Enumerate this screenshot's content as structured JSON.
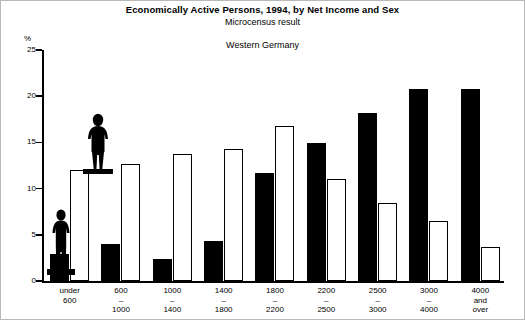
{
  "header": {
    "title": "Economically Active Persons, 1994, by Net Income and Sex",
    "subtitle": "Microcensus result",
    "region": "Western Germany"
  },
  "axes": {
    "unit_label": "%",
    "y_ticks": [
      "25",
      "20",
      "15",
      "10",
      "5",
      "0"
    ]
  },
  "chart_data": {
    "type": "bar",
    "title": "Economically Active Persons, 1994, by Net Income and Sex",
    "subtitle": "Microcensus result",
    "annotation": "Western Germany",
    "xlabel": "",
    "ylabel": "%",
    "ylim": [
      0,
      25
    ],
    "grid": false,
    "legend": "none",
    "categories": [
      "under\n600",
      "600\n–\n1000",
      "1000\n–\n1400",
      "1400\n–\n1800",
      "1800\n–\n2200",
      "2200\n–\n2500",
      "2500\n–\n3000",
      "3000\n–\n4000",
      "4000\nand\nover"
    ],
    "series": [
      {
        "name": "Men",
        "color": "#000000",
        "values": [
          2.9,
          4.0,
          2.4,
          4.3,
          11.7,
          14.9,
          18.2,
          20.8,
          20.8
        ]
      },
      {
        "name": "Women",
        "color": "#ffffff",
        "values": [
          12.0,
          12.7,
          13.8,
          14.3,
          16.8,
          11.0,
          8.4,
          6.5,
          3.7
        ]
      }
    ]
  },
  "categories_display": [
    [
      "under",
      "600"
    ],
    [
      "600",
      "–",
      "1000"
    ],
    [
      "1000",
      "–",
      "1400"
    ],
    [
      "1400",
      "–",
      "1800"
    ],
    [
      "1800",
      "–",
      "2200"
    ],
    [
      "2200",
      "–",
      "2500"
    ],
    [
      "2500",
      "–",
      "3000"
    ],
    [
      "3000",
      "–",
      "4000"
    ],
    [
      "4000",
      "and",
      "over"
    ]
  ],
  "pictograms": [
    {
      "name": "man-figure",
      "fill": "#000000"
    },
    {
      "name": "woman-figure",
      "fill": "#000000"
    }
  ]
}
